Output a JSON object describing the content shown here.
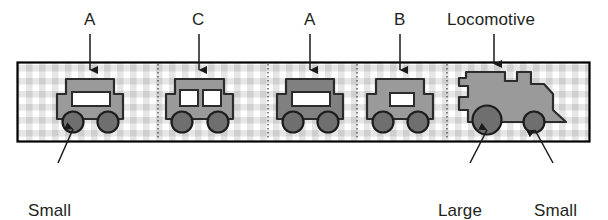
{
  "figure": {
    "type": "train-diagram",
    "frame": {
      "border_color": "#000000",
      "background_pattern": "checkered",
      "pattern_color": "#c9c9c9",
      "pattern_background": "#ffffff"
    },
    "body_fill": "#9a9a9a",
    "body_stroke": "#2b2b2b",
    "wheel_fill": "#6f6f6f",
    "wheel_stroke": "#1c1c1c",
    "window_fill": "#ffffff",
    "divider_style": "dotted"
  },
  "top_labels": [
    {
      "text": "A",
      "name": "label-car-a-1"
    },
    {
      "text": "C",
      "name": "label-car-c"
    },
    {
      "text": "A",
      "name": "label-car-a-2"
    },
    {
      "text": "B",
      "name": "label-car-b"
    },
    {
      "text": "Locomotive",
      "name": "label-locomotive"
    }
  ],
  "bottom_labels": [
    {
      "line1": "Small",
      "line2": "wheel",
      "name": "label-small-wheel-left"
    },
    {
      "line1": "Large",
      "line2": "wheel",
      "name": "label-large-wheel"
    },
    {
      "line1": "Small",
      "line2": "wheel",
      "name": "label-small-wheel-right"
    }
  ],
  "vehicles": [
    {
      "id": "car-a-1",
      "label": "A",
      "kind": "carriage",
      "windows": 1,
      "window_style": "wide",
      "wheels": 2,
      "wheel_size": "small"
    },
    {
      "id": "car-c",
      "label": "C",
      "kind": "carriage",
      "windows": 2,
      "window_style": "double",
      "wheels": 2,
      "wheel_size": "small"
    },
    {
      "id": "car-a-2",
      "label": "A",
      "kind": "carriage",
      "windows": 1,
      "window_style": "wide",
      "wheels": 2,
      "wheel_size": "small"
    },
    {
      "id": "car-b",
      "label": "B",
      "kind": "carriage",
      "windows": 1,
      "window_style": "narrow",
      "wheels": 2,
      "wheel_size": "small"
    },
    {
      "id": "locomotive",
      "label": "Locomotive",
      "kind": "locomotive",
      "windows": 0,
      "window_style": "none",
      "wheels": 2,
      "wheel_size": "large+small"
    }
  ]
}
